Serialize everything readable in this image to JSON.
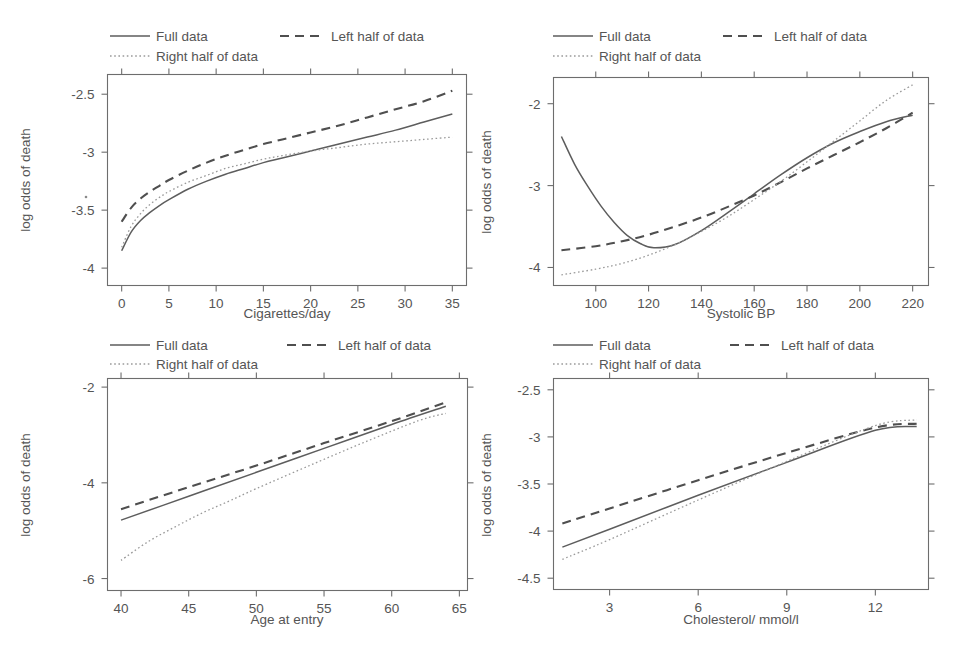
{
  "figure": {
    "title": "",
    "panel_count": 4,
    "shared_legend_entries": [
      {
        "key": "full",
        "label": "Full data",
        "style": "solid"
      },
      {
        "key": "left",
        "label": "Left half of data",
        "style": "dashed"
      },
      {
        "key": "right",
        "label": "Right half of data",
        "style": "dotted"
      }
    ],
    "line_color_full": "#5d5d5d",
    "line_color_left": "#4f4f4f",
    "line_color_right": "#9a9a9a",
    "axis_color": "#6d6d6d",
    "text_color": "#555555",
    "background": "#ffffff"
  },
  "chart_data": [
    {
      "id": "cigarettes",
      "type": "line",
      "title": "",
      "xlabel": "Cigarettes/day",
      "ylabel": "log odds of death",
      "xlim": [
        -1.5,
        36.5
      ],
      "ylim": [
        -4.15,
        -2.33
      ],
      "xticks": [
        0,
        5,
        10,
        15,
        20,
        25,
        30,
        35
      ],
      "xticklabels": [
        "0",
        "5",
        "10",
        "15",
        "20",
        "25",
        "30",
        "35"
      ],
      "yticks": [
        -2.5,
        -3,
        -3.5,
        -4
      ],
      "yticklabels": [
        "-2.5",
        "-3",
        "-3.5",
        "-4"
      ],
      "grid": false,
      "legend_position": "above-plot",
      "series": [
        {
          "name": "Full data",
          "style": "solid",
          "x": [
            0,
            1,
            2,
            3,
            4,
            5,
            7,
            9,
            11,
            13,
            15,
            17,
            20,
            23,
            26,
            29,
            32,
            35
          ],
          "y": [
            -3.85,
            -3.69,
            -3.59,
            -3.52,
            -3.46,
            -3.41,
            -3.32,
            -3.25,
            -3.19,
            -3.14,
            -3.09,
            -3.05,
            -2.99,
            -2.93,
            -2.87,
            -2.81,
            -2.74,
            -2.67
          ]
        },
        {
          "name": "Left half of data",
          "style": "dashed",
          "x": [
            0,
            1,
            2,
            3,
            4,
            5,
            7,
            9,
            11,
            13,
            15,
            17,
            20,
            23,
            26,
            29,
            32,
            35
          ],
          "y": [
            -3.6,
            -3.48,
            -3.4,
            -3.34,
            -3.29,
            -3.24,
            -3.16,
            -3.09,
            -3.03,
            -2.98,
            -2.93,
            -2.89,
            -2.83,
            -2.77,
            -2.7,
            -2.63,
            -2.56,
            -2.47
          ]
        },
        {
          "name": "Right half of data",
          "style": "dotted",
          "x": [
            0,
            1,
            2,
            3,
            4,
            5,
            7,
            9,
            11,
            13,
            15,
            17,
            20,
            23,
            26,
            29,
            32,
            35
          ],
          "y": [
            -3.82,
            -3.64,
            -3.53,
            -3.45,
            -3.39,
            -3.34,
            -3.26,
            -3.2,
            -3.14,
            -3.1,
            -3.06,
            -3.03,
            -2.99,
            -2.96,
            -2.93,
            -2.91,
            -2.89,
            -2.87
          ]
        }
      ]
    },
    {
      "id": "systolic-bp",
      "type": "line",
      "title": "",
      "xlabel": "Systolic BP",
      "ylabel": "log odds of death",
      "xlim": [
        84,
        226
      ],
      "ylim": [
        -4.22,
        -1.68
      ],
      "xticks": [
        100,
        120,
        140,
        160,
        180,
        200,
        220
      ],
      "xticklabels": [
        "100",
        "120",
        "140",
        "160",
        "180",
        "200",
        "220"
      ],
      "yticks": [
        -2,
        -3,
        -4
      ],
      "yticklabels": [
        "-2",
        "-3",
        "-4"
      ],
      "grid": false,
      "legend_position": "above-plot",
      "series": [
        {
          "name": "Full data",
          "style": "solid",
          "x": [
            87,
            92,
            97,
            102,
            107,
            112,
            117,
            122,
            130,
            140,
            150,
            160,
            170,
            180,
            190,
            200,
            210,
            220
          ],
          "y": [
            -2.4,
            -2.74,
            -3.01,
            -3.25,
            -3.45,
            -3.61,
            -3.71,
            -3.76,
            -3.72,
            -3.55,
            -3.33,
            -3.1,
            -2.87,
            -2.66,
            -2.48,
            -2.34,
            -2.22,
            -2.14
          ]
        },
        {
          "name": "Left half of data",
          "style": "dashed",
          "x": [
            87,
            100,
            110,
            120,
            130,
            140,
            150,
            160,
            170,
            180,
            190,
            200,
            210,
            220
          ],
          "y": [
            -3.79,
            -3.74,
            -3.68,
            -3.6,
            -3.5,
            -3.39,
            -3.26,
            -3.12,
            -2.96,
            -2.79,
            -2.63,
            -2.47,
            -2.3,
            -2.11
          ]
        },
        {
          "name": "Right half of data",
          "style": "dotted",
          "x": [
            87,
            100,
            110,
            120,
            130,
            140,
            150,
            160,
            170,
            180,
            190,
            200,
            210,
            220
          ],
          "y": [
            -4.09,
            -4.02,
            -3.95,
            -3.85,
            -3.72,
            -3.56,
            -3.38,
            -3.17,
            -2.95,
            -2.71,
            -2.46,
            -2.21,
            -1.96,
            -1.77
          ]
        }
      ]
    },
    {
      "id": "age-at-entry",
      "type": "line",
      "title": "",
      "xlabel": "Age at entry",
      "ylabel": "log odds of death",
      "xlim": [
        39,
        65.6
      ],
      "ylim": [
        -6.25,
        -1.82
      ],
      "xticks": [
        40,
        45,
        50,
        55,
        60,
        65
      ],
      "xticklabels": [
        "40",
        "45",
        "50",
        "55",
        "60",
        "65"
      ],
      "yticks": [
        -2,
        -4,
        -6
      ],
      "yticklabels": [
        "-2",
        "-4",
        "-6"
      ],
      "grid": false,
      "legend_position": "above-plot",
      "series": [
        {
          "name": "Full data",
          "style": "solid",
          "x": [
            40,
            45,
            50,
            55,
            60,
            64
          ],
          "y": [
            -4.78,
            -4.28,
            -3.78,
            -3.28,
            -2.78,
            -2.4
          ]
        },
        {
          "name": "Left half of data",
          "style": "dashed",
          "x": [
            40,
            45,
            50,
            55,
            60,
            64
          ],
          "y": [
            -4.55,
            -4.09,
            -3.64,
            -3.17,
            -2.71,
            -2.32
          ]
        },
        {
          "name": "Right half of data",
          "style": "dotted",
          "x": [
            40,
            42,
            44,
            46,
            48,
            50,
            54,
            58,
            62,
            64
          ],
          "y": [
            -5.62,
            -5.23,
            -4.92,
            -4.63,
            -4.38,
            -4.12,
            -3.63,
            -3.15,
            -2.7,
            -2.55
          ]
        }
      ]
    },
    {
      "id": "cholesterol",
      "type": "line",
      "title": "",
      "xlabel": "Cholesterol/ mmol/l",
      "ylabel": "log odds of death",
      "xlim": [
        1.1,
        13.8
      ],
      "ylim": [
        -4.62,
        -2.38
      ],
      "xticks": [
        3,
        6,
        9,
        12
      ],
      "xticklabels": [
        "3",
        "6",
        "9",
        "12"
      ],
      "yticks": [
        -2.5,
        -3,
        -3.5,
        -4,
        -4.5
      ],
      "yticklabels": [
        "-2.5",
        "-3",
        "-3.5",
        "-4",
        "-4.5"
      ],
      "grid": false,
      "legend_position": "above-plot",
      "series": [
        {
          "name": "Full data",
          "style": "solid",
          "x": [
            1.4,
            3,
            6,
            9,
            12,
            13.4
          ],
          "y": [
            -4.17,
            -3.98,
            -3.62,
            -3.27,
            -2.93,
            -2.89
          ]
        },
        {
          "name": "Left half of data",
          "style": "dashed",
          "x": [
            1.4,
            3,
            6,
            9,
            12,
            13.4
          ],
          "y": [
            -3.92,
            -3.76,
            -3.46,
            -3.17,
            -2.9,
            -2.86
          ]
        },
        {
          "name": "Right half of data",
          "style": "dotted",
          "x": [
            1.4,
            3,
            6,
            9,
            12,
            13.4
          ],
          "y": [
            -4.3,
            -4.09,
            -3.67,
            -3.26,
            -2.88,
            -2.82
          ]
        }
      ]
    }
  ]
}
